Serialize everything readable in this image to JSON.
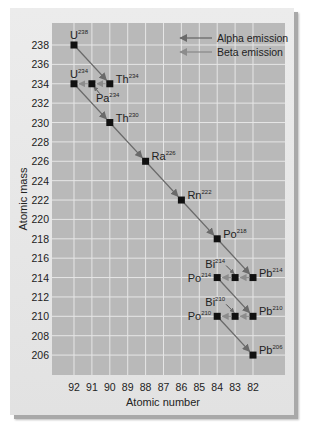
{
  "chart_data": {
    "type": "scatter",
    "title": "",
    "xlabel": "Atomic number",
    "ylabel": "Atomic mass",
    "x_ticks": [
      92,
      91,
      90,
      89,
      88,
      87,
      86,
      85,
      84,
      83,
      82
    ],
    "x_reversed": true,
    "y_ticks": [
      206,
      208,
      210,
      212,
      214,
      216,
      218,
      220,
      222,
      224,
      226,
      228,
      230,
      232,
      234,
      236,
      238
    ],
    "xlim": [
      92.4,
      81.4
    ],
    "ylim": [
      204.5,
      239.5
    ],
    "grid": true,
    "legend": {
      "position": "top-right",
      "entries": [
        {
          "label": "Alpha emission",
          "style": "alpha"
        },
        {
          "label": "Beta emission",
          "style": "beta"
        }
      ]
    },
    "nuclides": [
      {
        "symbol": "U",
        "mass": "238",
        "z": 92,
        "a": 238,
        "label_pos": "above"
      },
      {
        "symbol": "Th",
        "mass": "234",
        "z": 90,
        "a": 234,
        "label_pos": "right"
      },
      {
        "symbol": "Pa",
        "mass": "234",
        "z": 91,
        "a": 234,
        "label_pos": "below-right"
      },
      {
        "symbol": "U",
        "mass": "234",
        "z": 92,
        "a": 234,
        "label_pos": "above"
      },
      {
        "symbol": "Th",
        "mass": "230",
        "z": 90,
        "a": 230,
        "label_pos": "right"
      },
      {
        "symbol": "Ra",
        "mass": "226",
        "z": 88,
        "a": 226,
        "label_pos": "right"
      },
      {
        "symbol": "Rn",
        "mass": "222",
        "z": 86,
        "a": 222,
        "label_pos": "right"
      },
      {
        "symbol": "Po",
        "mass": "218",
        "z": 84,
        "a": 218,
        "label_pos": "right"
      },
      {
        "symbol": "Pb",
        "mass": "214",
        "z": 82,
        "a": 214,
        "label_pos": "right"
      },
      {
        "symbol": "Bi",
        "mass": "214",
        "z": 83,
        "a": 214,
        "label_pos": "above-left"
      },
      {
        "symbol": "Po",
        "mass": "214",
        "z": 84,
        "a": 214,
        "label_pos": "left"
      },
      {
        "symbol": "Pb",
        "mass": "210",
        "z": 82,
        "a": 210,
        "label_pos": "right"
      },
      {
        "symbol": "Bi",
        "mass": "210",
        "z": 83,
        "a": 210,
        "label_pos": "above-left"
      },
      {
        "symbol": "Po",
        "mass": "210",
        "z": 84,
        "a": 210,
        "label_pos": "left"
      },
      {
        "symbol": "Pb",
        "mass": "206",
        "z": 82,
        "a": 206,
        "label_pos": "right"
      }
    ],
    "decays": [
      {
        "type": "alpha",
        "from": [
          92,
          238
        ],
        "to": [
          90,
          234
        ]
      },
      {
        "type": "beta",
        "from": [
          90,
          234
        ],
        "to": [
          91,
          234
        ]
      },
      {
        "type": "beta",
        "from": [
          91,
          234
        ],
        "to": [
          92,
          234
        ]
      },
      {
        "type": "alpha",
        "from": [
          92,
          234
        ],
        "to": [
          90,
          230
        ]
      },
      {
        "type": "alpha",
        "from": [
          90,
          230
        ],
        "to": [
          88,
          226
        ]
      },
      {
        "type": "alpha",
        "from": [
          88,
          226
        ],
        "to": [
          86,
          222
        ]
      },
      {
        "type": "alpha",
        "from": [
          86,
          222
        ],
        "to": [
          84,
          218
        ]
      },
      {
        "type": "alpha",
        "from": [
          84,
          218
        ],
        "to": [
          82,
          214
        ]
      },
      {
        "type": "beta",
        "from": [
          82,
          214
        ],
        "to": [
          83,
          214
        ]
      },
      {
        "type": "beta",
        "from": [
          83,
          214
        ],
        "to": [
          84,
          214
        ]
      },
      {
        "type": "alpha",
        "from": [
          84,
          214
        ],
        "to": [
          82,
          210
        ]
      },
      {
        "type": "beta",
        "from": [
          82,
          210
        ],
        "to": [
          83,
          210
        ]
      },
      {
        "type": "beta",
        "from": [
          83,
          210
        ],
        "to": [
          84,
          210
        ]
      },
      {
        "type": "alpha",
        "from": [
          84,
          210
        ],
        "to": [
          82,
          206
        ]
      }
    ],
    "colors": {
      "plot_bg": "#b9b9b9",
      "grid": "#e6e6e6",
      "card_bg": "#e6e6e6",
      "alpha_arrow": "#6a6a6a",
      "beta_arrow": "#8c8c8c",
      "marker": "#111111",
      "text": "#222222"
    }
  }
}
